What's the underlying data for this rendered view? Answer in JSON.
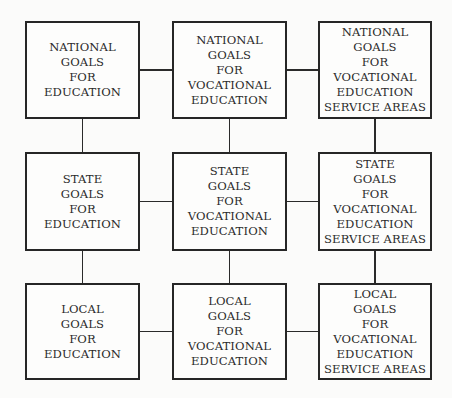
{
  "diagram": {
    "rows": [
      "national",
      "state",
      "local"
    ],
    "columns": [
      "education",
      "vocational-education",
      "vocational-education-service-areas"
    ],
    "boxes": [
      {
        "id": "national-education",
        "row": 0,
        "col": 0,
        "lines": [
          "NATIONAL",
          "GOALS",
          "FOR",
          "EDUCATION"
        ]
      },
      {
        "id": "national-vocational-education",
        "row": 0,
        "col": 1,
        "lines": [
          "NATIONAL",
          "GOALS",
          "FOR",
          "VOCATIONAL",
          "EDUCATION"
        ]
      },
      {
        "id": "national-vocational-service-areas",
        "row": 0,
        "col": 2,
        "lines": [
          "NATIONAL",
          "GOALS",
          "FOR",
          "VOCATIONAL",
          "EDUCATION",
          "SERVICE AREAS"
        ]
      },
      {
        "id": "state-education",
        "row": 1,
        "col": 0,
        "lines": [
          "STATE",
          "GOALS",
          "FOR",
          "EDUCATION"
        ]
      },
      {
        "id": "state-vocational-education",
        "row": 1,
        "col": 1,
        "lines": [
          "STATE",
          "GOALS",
          "FOR",
          "VOCATIONAL",
          "EDUCATION"
        ]
      },
      {
        "id": "state-vocational-service-areas",
        "row": 1,
        "col": 2,
        "lines": [
          "STATE",
          "GOALS",
          "FOR",
          "VOCATIONAL",
          "EDUCATION",
          "SERVICE AREAS"
        ]
      },
      {
        "id": "local-education",
        "row": 2,
        "col": 0,
        "lines": [
          "LOCAL",
          "GOALS",
          "FOR",
          "EDUCATION"
        ]
      },
      {
        "id": "local-vocational-education",
        "row": 2,
        "col": 1,
        "lines": [
          "LOCAL",
          "GOALS",
          "FOR",
          "VOCATIONAL",
          "EDUCATION"
        ]
      },
      {
        "id": "local-vocational-service-areas",
        "row": 2,
        "col": 2,
        "lines": [
          "LOCAL",
          "GOALS",
          "FOR",
          "VOCATIONAL",
          "EDUCATION",
          "SERVICE AREAS"
        ]
      }
    ],
    "connections": "grid-adjacent"
  }
}
